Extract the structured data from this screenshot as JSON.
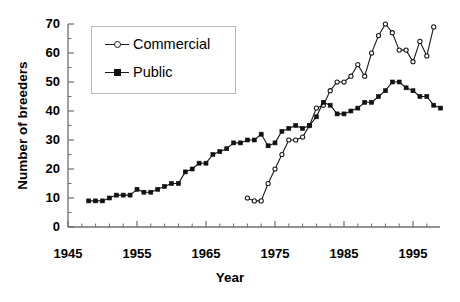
{
  "chart_data": {
    "type": "line",
    "title": "",
    "xlabel": "Year",
    "ylabel": "Number of breeders",
    "xlim": [
      1945,
      1999
    ],
    "ylim": [
      0,
      70
    ],
    "xticks": [
      1945,
      1955,
      1965,
      1975,
      1985,
      1995
    ],
    "yticks": [
      0,
      10,
      20,
      30,
      40,
      50,
      60,
      70
    ],
    "xtick_labels": [
      "1945",
      "1955",
      "1965",
      "1975",
      "1985",
      "1995"
    ],
    "ytick_labels": [
      "0",
      "10",
      "20",
      "30",
      "40",
      "50",
      "60",
      "70"
    ],
    "x_minor_tick_interval": 2,
    "y_minor_tick_interval": 5,
    "grid": false,
    "legend_position": "upper-left-inside",
    "series": [
      {
        "name": "Commercial",
        "marker": "open-circle",
        "color": "#1a1a1a",
        "points": [
          [
            1971,
            10
          ],
          [
            1972,
            9
          ],
          [
            1973,
            9
          ],
          [
            1974,
            15
          ],
          [
            1975,
            20
          ],
          [
            1976,
            25
          ],
          [
            1977,
            30
          ],
          [
            1978,
            30
          ],
          [
            1979,
            31
          ],
          [
            1980,
            35
          ],
          [
            1981,
            41
          ],
          [
            1982,
            42
          ],
          [
            1983,
            47
          ],
          [
            1984,
            50
          ],
          [
            1985,
            50
          ],
          [
            1986,
            52
          ],
          [
            1987,
            56
          ],
          [
            1988,
            52
          ],
          [
            1989,
            60
          ],
          [
            1990,
            66
          ],
          [
            1991,
            70
          ],
          [
            1992,
            67
          ],
          [
            1993,
            61
          ],
          [
            1994,
            61
          ],
          [
            1995,
            57
          ],
          [
            1996,
            64
          ],
          [
            1997,
            59
          ],
          [
            1998,
            69
          ]
        ]
      },
      {
        "name": "Public",
        "marker": "filled-square",
        "color": "#111111",
        "points": [
          [
            1948,
            9
          ],
          [
            1949,
            9
          ],
          [
            1950,
            9
          ],
          [
            1951,
            10
          ],
          [
            1952,
            11
          ],
          [
            1953,
            11
          ],
          [
            1954,
            11
          ],
          [
            1955,
            13
          ],
          [
            1956,
            12
          ],
          [
            1957,
            12
          ],
          [
            1958,
            13
          ],
          [
            1959,
            14
          ],
          [
            1960,
            15
          ],
          [
            1961,
            15
          ],
          [
            1962,
            19
          ],
          [
            1963,
            20
          ],
          [
            1964,
            22
          ],
          [
            1965,
            22
          ],
          [
            1966,
            25
          ],
          [
            1967,
            26
          ],
          [
            1968,
            27
          ],
          [
            1969,
            29
          ],
          [
            1970,
            29
          ],
          [
            1971,
            30
          ],
          [
            1972,
            30
          ],
          [
            1973,
            32
          ],
          [
            1974,
            28
          ],
          [
            1975,
            29
          ],
          [
            1976,
            33
          ],
          [
            1977,
            34
          ],
          [
            1978,
            35
          ],
          [
            1979,
            34
          ],
          [
            1980,
            35
          ],
          [
            1981,
            38
          ],
          [
            1982,
            43
          ],
          [
            1983,
            42
          ],
          [
            1984,
            39
          ],
          [
            1985,
            39
          ],
          [
            1986,
            40
          ],
          [
            1987,
            41
          ],
          [
            1988,
            43
          ],
          [
            1989,
            43
          ],
          [
            1990,
            45
          ],
          [
            1991,
            47
          ],
          [
            1992,
            50
          ],
          [
            1993,
            50
          ],
          [
            1994,
            48
          ],
          [
            1995,
            47
          ],
          [
            1996,
            45
          ],
          [
            1997,
            45
          ],
          [
            1998,
            42
          ],
          [
            1999,
            41
          ]
        ]
      }
    ],
    "legend_entries": [
      {
        "label": "Commercial",
        "marker": "open-circle"
      },
      {
        "label": "Public",
        "marker": "filled-square"
      }
    ]
  }
}
